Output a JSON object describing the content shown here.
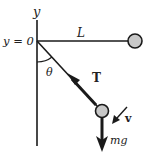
{
  "diagram": {
    "labels": {
      "y_axis": "y",
      "y_zero": "y = 0",
      "length": "L",
      "angle": "θ",
      "tension": "T",
      "velocity": "v",
      "weight": "mg"
    },
    "colors": {
      "line": "#1a1a1a",
      "bob_fill": "#c8c8c8",
      "background": "#ffffff"
    }
  }
}
